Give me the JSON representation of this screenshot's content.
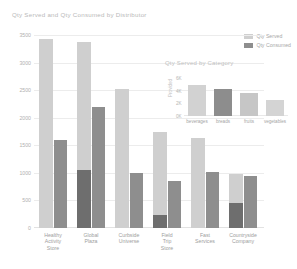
{
  "main": {
    "title": "Qty Served and Qty Consumed by Distributor",
    "legend": [
      {
        "label": "Qty Served",
        "color": "#cfcfcf"
      },
      {
        "label": "Qty Consumed",
        "color": "#8e8e8e"
      }
    ]
  },
  "inset": {
    "title": "Qty Served by Category",
    "ylabel": "Provided"
  },
  "caption": "",
  "chart_data": [
    {
      "type": "bar",
      "title": "Qty Served and Qty Consumed by Distributor",
      "xlabel": "",
      "ylabel": "",
      "ylim": [
        0,
        3500
      ],
      "yticks": [
        0,
        500,
        1000,
        1500,
        2000,
        2500,
        3000,
        3500
      ],
      "ytick_labels": [
        "0",
        "500",
        "1000",
        "1500",
        "2000",
        "2500",
        "3000",
        "3500"
      ],
      "grid": true,
      "legend_position": "top-right",
      "categories": [
        "Healthy Activity Store",
        "Global Plaza",
        "Curbside Universe",
        "Field Trip Store",
        "Fast Services",
        "Countryside Company"
      ],
      "series": [
        {
          "name": "Qty Served",
          "color": "#cfcfcf",
          "values": [
            3420,
            3370,
            2520,
            1750,
            1640,
            980
          ]
        },
        {
          "name": "Qty Consumed",
          "color": "#8e8e8e",
          "values": [
            1590,
            2200,
            1000,
            860,
            1010,
            940
          ]
        }
      ],
      "series_overlay": [
        {
          "name": "Qty Consumed (dark)",
          "color": "#6e6e6e",
          "values": [
            0,
            1060,
            0,
            230,
            0,
            450
          ]
        }
      ]
    },
    {
      "type": "bar",
      "title": "Qty Served by Category",
      "xlabel": "",
      "ylabel": "Provided",
      "ylim": [
        0,
        6000
      ],
      "yticks": [
        0,
        2000,
        4000,
        6000
      ],
      "ytick_labels": [
        "0K",
        "2K",
        "4K",
        "6K"
      ],
      "grid": false,
      "categories": [
        "beverages",
        "breads",
        "fruits",
        "vegetables"
      ],
      "values": [
        4900,
        4200,
        3700,
        2500
      ],
      "colors": [
        "#d2d2d2",
        "#8d8d8d",
        "#c6c6c6",
        "#d4d4d4"
      ]
    }
  ]
}
